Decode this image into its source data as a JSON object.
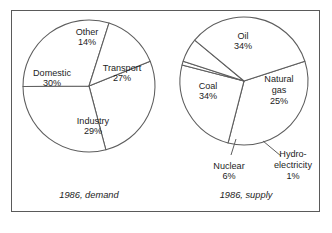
{
  "figure": {
    "background_color": "#ffffff",
    "frame_color": "#5a5a5a",
    "line_color": "#5d5d5d",
    "text_color": "#1d1d1d"
  },
  "chart_data": [
    {
      "type": "pie",
      "title": "1986, demand",
      "caption": "1986, demand",
      "unit": "%",
      "start_angle_deg": -22,
      "direction": "clockwise",
      "center": {
        "x": 89,
        "y": 86
      },
      "radius": 66,
      "categories": [
        "Transport",
        "Industry",
        "Domestic",
        "Other"
      ],
      "values": [
        27,
        29,
        30,
        14
      ],
      "slices": [
        {
          "label": "Transport",
          "value": 27,
          "value_text": "27%",
          "label_lines": [
            "Transport",
            "27%"
          ],
          "label_x": 122,
          "label_y": 74,
          "leader": false
        },
        {
          "label": "Industry",
          "value": 29,
          "value_text": "29%",
          "label_lines": [
            "Industry",
            "29%"
          ],
          "label_x": 93,
          "label_y": 127,
          "leader": false
        },
        {
          "label": "Domestic",
          "value": 30,
          "value_text": "30%",
          "label_lines": [
            "Domestic",
            "30%"
          ],
          "label_x": 52,
          "label_y": 79,
          "leader": false
        },
        {
          "label": "Other",
          "value": 14,
          "value_text": "14%",
          "label_lines": [
            "Other",
            "14%"
          ],
          "label_x": 87,
          "label_y": 38,
          "leader": false
        }
      ]
    },
    {
      "type": "pie",
      "title": "1986, supply",
      "caption": "1986, supply",
      "unit": "%",
      "start_angle_deg": -18,
      "direction": "clockwise",
      "center": {
        "x": 244,
        "y": 81
      },
      "radius": 64,
      "categories": [
        "Oil",
        "Natural gas",
        "Hydro-electricity",
        "Nuclear",
        "Coal"
      ],
      "values": [
        34,
        25,
        1,
        6,
        34
      ],
      "slices": [
        {
          "label": "Oil",
          "value": 34,
          "value_text": "34%",
          "label_lines": [
            "Oil",
            "34%"
          ],
          "label_x": 243,
          "label_y": 42,
          "leader": false
        },
        {
          "label": "Natural gas",
          "value": 25,
          "value_text": "25%",
          "label_lines": [
            "Natural",
            "gas",
            "25%"
          ],
          "label_x": 279,
          "label_y": 91,
          "leader": false
        },
        {
          "label": "Hydro-electricity",
          "value": 1,
          "value_text": "1%",
          "label_lines": [
            "Hydro-",
            "electricity",
            "1%"
          ],
          "label_x": 293,
          "label_y": 166,
          "leader": true,
          "leader_points": [
            [
              263,
              141
            ],
            [
              281,
              156
            ]
          ]
        },
        {
          "label": "Nuclear",
          "value": 6,
          "value_text": "6%",
          "label_lines": [
            "Nuclear",
            "6%"
          ],
          "label_x": 229,
          "label_y": 172,
          "leader": true,
          "leader_points": [
            [
              236,
              139
            ],
            [
              231,
              155
            ]
          ]
        },
        {
          "label": "Coal",
          "value": 34,
          "value_text": "34%",
          "label_lines": [
            "Coal",
            "34%"
          ],
          "label_x": 208,
          "label_y": 92,
          "leader": false
        }
      ]
    }
  ],
  "captions": [
    {
      "text": "1986, demand",
      "x": 89,
      "y": 198
    },
    {
      "text": "1986, supply",
      "x": 246,
      "y": 198
    }
  ]
}
